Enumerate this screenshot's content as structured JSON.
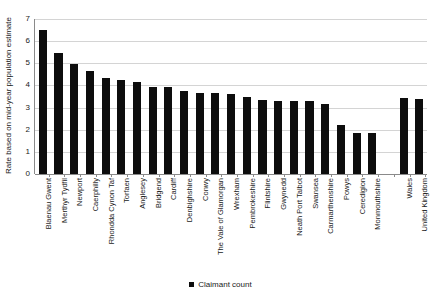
{
  "chart_data": {
    "type": "bar",
    "title": "",
    "xlabel": "",
    "ylabel": "Rate based on mid-year population estimate",
    "ylim": [
      0,
      7
    ],
    "yticks": [
      0,
      1,
      2,
      3,
      4,
      5,
      6,
      7
    ],
    "grid": true,
    "legend_position": "bottom",
    "series_name": "Claimant count",
    "bar_color": "#0d0d0d",
    "grid_color": "#d4d4d4",
    "axis_color": "#8a8a8a",
    "categories": [
      "Blaenau Gwent",
      "Merthyr Tydfil",
      "Newport",
      "Caerphilly",
      "Rhondda Cynon Taf",
      "Torfaen",
      "Anglesey",
      "Bridgend",
      "Cardiff",
      "Denbighshire",
      "Conwy",
      "The Vale of Glamorgan",
      "Wrexham",
      "Pembrokeshire",
      "Flintshire",
      "Gwynedd",
      "Neath Port Talbot",
      "Swansea",
      "Carmarthenshire",
      "Powys",
      "Ceredigion",
      "Monmouthshire",
      "",
      "Wales",
      "United Kingdom"
    ],
    "values": [
      6.5,
      5.45,
      4.95,
      4.65,
      4.35,
      4.25,
      4.15,
      3.95,
      3.95,
      3.75,
      3.65,
      3.65,
      3.6,
      3.5,
      3.35,
      3.3,
      3.3,
      3.3,
      3.15,
      2.2,
      1.85,
      1.85,
      null,
      3.45,
      3.4
    ]
  },
  "legend": {
    "label": "Claimant count",
    "marker": "square-marker"
  }
}
